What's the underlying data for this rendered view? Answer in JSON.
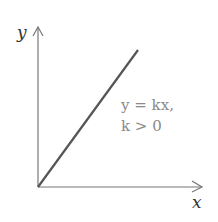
{
  "diagram": {
    "axes": {
      "x_label": "x",
      "y_label": "y"
    },
    "line": {
      "equation": "y = kx,",
      "condition": "k > 0"
    },
    "colors": {
      "axis": "#6a6a6a",
      "line": "#555555",
      "text": "#8a8a8a"
    }
  }
}
